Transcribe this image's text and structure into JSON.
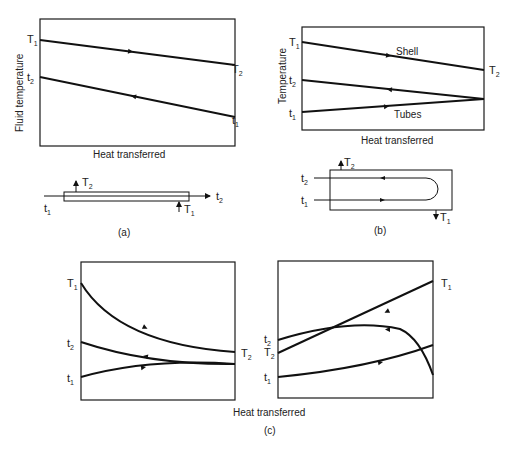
{
  "figure": {
    "panels": [
      {
        "id": "a",
        "caption": "(a)",
        "ylabel": "Fluid temperature",
        "xlabel": "Heat transferred",
        "curves": [
          {
            "name": "hot",
            "start_label": "T",
            "start_sub": "1",
            "end_label": "T",
            "end_sub": "2"
          },
          {
            "name": "cold",
            "start_label": "t",
            "start_sub": "2",
            "end_label": "t",
            "end_sub": "1"
          }
        ],
        "schematic": {
          "in_left": "t",
          "in_left_sub": "1",
          "out_right": "t",
          "out_right_sub": "2",
          "top": "T",
          "top_sub": "2",
          "bottom": "T",
          "bottom_sub": "1"
        }
      },
      {
        "id": "b",
        "caption": "(b)",
        "ylabel": "Temperature",
        "xlabel": "Heat transferred",
        "curve_labels": {
          "shell": "Shell",
          "tubes": "Tubes"
        },
        "left_labels": [
          {
            "l": "T",
            "s": "1"
          },
          {
            "l": "t",
            "s": "2"
          },
          {
            "l": "t",
            "s": "1"
          }
        ],
        "right_label": {
          "l": "T",
          "s": "2"
        },
        "schematic": {
          "t2": "t",
          "t2_sub": "2",
          "t1": "t",
          "t1_sub": "1",
          "top": "T",
          "top_sub": "2",
          "bottom": "T",
          "bottom_sub": "1"
        }
      },
      {
        "id": "c",
        "caption": "(c)",
        "xlabel": "Heat transferred",
        "left": {
          "labels": [
            {
              "l": "T",
              "s": "1"
            },
            {
              "l": "t",
              "s": "2"
            },
            {
              "l": "t",
              "s": "1"
            }
          ],
          "right_label": {
            "l": "T",
            "s": "2"
          }
        },
        "right": {
          "labels": [
            {
              "l": "t",
              "s": "2"
            },
            {
              "l": "T",
              "s": "2"
            },
            {
              "l": "t",
              "s": "1"
            }
          ],
          "right_label": {
            "l": "T",
            "s": "1"
          }
        }
      }
    ]
  }
}
